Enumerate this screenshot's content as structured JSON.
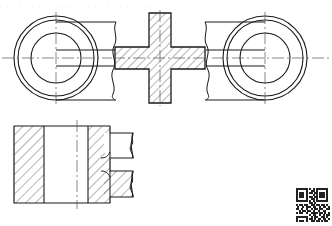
{
  "document": {
    "kind": "engineering-drawing",
    "title": "Mechanical Part Orthographic Drawing",
    "sheet_background": "#ffffff",
    "line_color": "#1a1a1a",
    "hatch_color": "#2b2b2b",
    "centerline_color": "#555555",
    "header_partial_text": "- -    -   -  - - -    - - - -   - - - -    - - - -  - -    - - - -"
  },
  "views": [
    {
      "id": "top-view",
      "name": "Top Sectional View",
      "bounds": {
        "x": 12,
        "y": 14,
        "width": 310,
        "height": 92
      },
      "elements": {
        "left_boss": {
          "name": "left-circular-boss",
          "center": [
            56,
            58
          ],
          "circles_diameter": [
            84,
            76,
            50
          ],
          "centerline_h": {
            "x1": 2,
            "x2": 112,
            "y": 58
          },
          "centerline_v": {
            "y1": 12,
            "y2": 106,
            "x": 56
          }
        },
        "right_boss": {
          "name": "right-circular-boss",
          "center": [
            265,
            58
          ],
          "circles_diameter": [
            84,
            76,
            50
          ],
          "centerline_h": {
            "x1": 212,
            "x2": 330,
            "y": 58
          },
          "centerline_v": {
            "y1": 12,
            "y2": 106,
            "x": 265
          }
        },
        "center_cross": {
          "name": "cross-section-body",
          "center": [
            160,
            58
          ],
          "arm_half_width": 11,
          "half_span_x": 45,
          "half_span_y": 45,
          "hatch_angle_deg": 45,
          "hatch_spacing": 6
        },
        "left_arm": {
          "name": "left-connecting-arm",
          "x1": 56,
          "x2": 115,
          "y_top": 50,
          "y_bottom": 66
        },
        "right_arm": {
          "name": "right-connecting-arm",
          "x1": 205,
          "x2": 265,
          "y_top": 50,
          "y_bottom": 66
        },
        "break_lines": [
          {
            "name": "break-line-left",
            "x": 113,
            "y1": 22,
            "y2": 100
          },
          {
            "name": "break-line-right",
            "x": 207,
            "y1": 22,
            "y2": 100
          }
        ],
        "outer_body_edges": [
          {
            "name": "left-body-top-edge",
            "x1": 56,
            "x2": 116,
            "y": 22
          },
          {
            "name": "left-body-bottom-edge",
            "x1": 56,
            "x2": 116,
            "y": 100
          },
          {
            "name": "right-body-top-edge",
            "x1": 204,
            "x2": 265,
            "y": 22
          },
          {
            "name": "right-body-bottom-edge",
            "x1": 204,
            "x2": 265,
            "y": 100
          }
        ]
      }
    },
    {
      "id": "front-view",
      "name": "Front Sectional View",
      "bounds": {
        "x": 14,
        "y": 123,
        "width": 120,
        "height": 82
      },
      "elements": {
        "outline": {
          "name": "front-view-outline",
          "left": 14,
          "right": 133,
          "top": 126,
          "bottom": 203
        },
        "hatched_left_band": {
          "name": "left-hatched-band",
          "x1": 14,
          "x2": 44,
          "y1": 126,
          "y2": 203,
          "hatch_angle_deg": 45,
          "hatch_spacing": 7
        },
        "hatched_right_band": {
          "name": "right-hatched-band",
          "x1": 88,
          "x2": 110,
          "y1": 126,
          "y2": 203,
          "hatch_angle_deg": 45,
          "hatch_spacing": 7
        },
        "plain_middle": {
          "name": "middle-plain-region",
          "x1": 44,
          "x2": 88,
          "y1": 126,
          "y2": 203
        },
        "centerline_v": {
          "name": "front-view-centerline",
          "x": 77,
          "y1": 120,
          "y2": 209
        },
        "steps": [
          {
            "name": "upper-step-notch",
            "x1": 104,
            "x2": 133,
            "y1": 133,
            "y2": 158
          },
          {
            "name": "lower-step-notch",
            "x1": 104,
            "x2": 133,
            "y1": 171,
            "y2": 197
          }
        ],
        "break_lines": [
          {
            "name": "front-break-line-upper",
            "x": 131,
            "y1": 133,
            "y2": 158
          },
          {
            "name": "front-break-line-lower",
            "x": 131,
            "y1": 171,
            "y2": 197
          }
        ]
      }
    }
  ],
  "qr_code": {
    "name": "qr-code-watermark",
    "position": [
      296,
      188
    ],
    "size": 34,
    "modules": 17,
    "bits": [
      "11111110101011111110",
      "10000010011010000010",
      "10111010110110111010",
      "10111010001010111010",
      "10111010110110111010",
      "10000010011010000010",
      "11111110101011111110",
      "00000000110100000000",
      "10110110011011011010",
      "01001011101100101101",
      "11010010010110110011",
      "00101101101001001100",
      "10110010011110110101",
      "00000000101100101011",
      "11111110010110011010",
      "10000010110101101101",
      "10111010011011010110"
    ]
  }
}
